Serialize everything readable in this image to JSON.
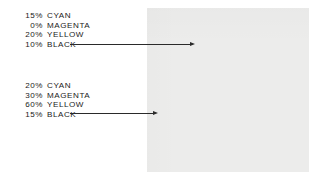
{
  "figure": {
    "type": "cmyk-tint-callout-diagram",
    "background_color": "#ffffff"
  },
  "callouts": [
    {
      "id": "inner-swatch-callout",
      "target": "inner-square",
      "inks": [
        {
          "percent": "15%",
          "name": "CYAN"
        },
        {
          "percent": "0%",
          "name": "MAGENTA"
        },
        {
          "percent": "20%",
          "name": "YELLOW"
        },
        {
          "percent": "10%",
          "name": "BLACK"
        }
      ]
    },
    {
      "id": "outer-swatch-callout",
      "target": "outer-square",
      "inks": [
        {
          "percent": "20%",
          "name": "CYAN"
        },
        {
          "percent": "30%",
          "name": "MAGENTA"
        },
        {
          "percent": "60%",
          "name": "YELLOW"
        },
        {
          "percent": "15%",
          "name": "BLACK"
        }
      ]
    }
  ],
  "swatches": {
    "outer": {
      "label": "outer-square",
      "color": "#ececeb"
    },
    "inner": {
      "label": "inner-square",
      "color": "#a2a2a2"
    }
  },
  "line_color": "#2a2a2a"
}
